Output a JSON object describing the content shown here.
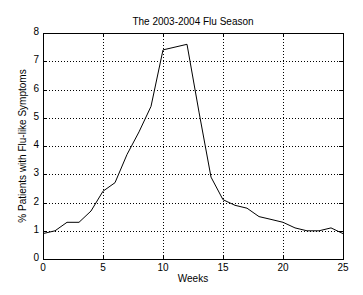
{
  "chart_data": {
    "type": "line",
    "title": "The 2003-2004 Flu Season",
    "xlabel": "Weeks",
    "ylabel": "% Patients with Flu-like Symptoms",
    "xlim": [
      0,
      25
    ],
    "ylim": [
      0,
      8
    ],
    "xticks": [
      0,
      5,
      10,
      15,
      20,
      25
    ],
    "yticks": [
      0,
      1,
      2,
      3,
      4,
      5,
      6,
      7,
      8
    ],
    "grid": true,
    "legend": null,
    "series": [
      {
        "name": "Flu-like Symptoms",
        "color": "#000000",
        "x": [
          0,
          1,
          2,
          3,
          4,
          5,
          6,
          7,
          8,
          9,
          10,
          11,
          12,
          13,
          14,
          15,
          16,
          17,
          18,
          19,
          20,
          21,
          22,
          23,
          24,
          25
        ],
        "values": [
          0.9,
          1.0,
          1.3,
          1.3,
          1.7,
          2.4,
          2.7,
          3.7,
          4.5,
          5.4,
          7.4,
          7.5,
          7.6,
          5.2,
          2.9,
          2.1,
          1.9,
          1.8,
          1.5,
          1.4,
          1.3,
          1.1,
          1.0,
          1.0,
          1.1,
          0.9
        ]
      }
    ]
  },
  "labels": {
    "title": "The 2003-2004 Flu Season",
    "xlabel": "Weeks",
    "ylabel": "% Patients with Flu-like Symptoms"
  },
  "colors": {
    "line": "#000000",
    "axis": "#000000",
    "grid": "#000000",
    "background": "#ffffff"
  }
}
